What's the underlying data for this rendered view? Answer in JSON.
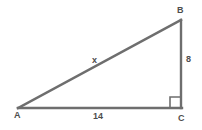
{
  "figure": {
    "kind": "right-triangle-diagram",
    "background_color": "#ffffff",
    "stroke_color": "#6e6e6e",
    "text_color": "#4d4d4d",
    "stroke_width": 2
  },
  "vertices": {
    "a": {
      "label": "A",
      "x": 18,
      "y": 108
    },
    "b": {
      "label": "B",
      "x": 181,
      "y": 20
    },
    "c": {
      "label": "C",
      "x": 181,
      "y": 108
    }
  },
  "sides": {
    "hypotenuse": {
      "label": "x",
      "from": "A",
      "to": "B"
    },
    "vertical": {
      "label": "8",
      "from": "B",
      "to": "C"
    },
    "base": {
      "label": "14",
      "from": "A",
      "to": "C"
    }
  },
  "markers": {
    "right_angle": {
      "at": "C",
      "size": 10
    }
  }
}
